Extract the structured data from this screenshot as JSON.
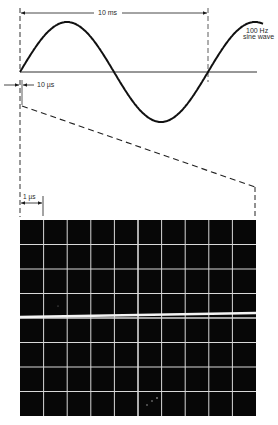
{
  "figure": {
    "top_panel": {
      "period_label": "10 ms",
      "signal_label_line1": "100 Hz",
      "signal_label_line2": "sine wave",
      "window_label": "10 µs",
      "waveform": {
        "type": "sine",
        "cycles_shown": 1.25,
        "axis_y": 72,
        "amplitude_px": 50,
        "x_start": 20,
        "period_px": 188
      }
    },
    "scope_panel": {
      "division_label": "1 µs",
      "grid_columns": 10,
      "grid_rows": 8,
      "trace": "nearly flat line (small slope) near center",
      "screen_color": "#070707",
      "grid_color": "#d8d8d8",
      "trace_color": "#f2f2f2"
    },
    "colors": {
      "ink": "#1a1a1a",
      "dashed": "#333333",
      "background": "#ffffff"
    }
  }
}
